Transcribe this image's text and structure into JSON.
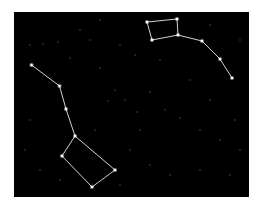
{
  "image": {
    "width": 263,
    "height": 208,
    "background": "#ffffff",
    "sky": {
      "x": 14,
      "y": 12,
      "width": 235,
      "height": 185,
      "color": "#000000"
    },
    "line_color": "#e8e8e8",
    "star_color": "#ffffff",
    "faint_star_color": "#5a5a5a"
  },
  "constellations": [
    {
      "name": "big-dipper",
      "stars": [
        [
          31.5,
          65
        ],
        [
          59.5,
          86
        ],
        [
          66,
          109
        ],
        [
          75,
          136
        ],
        [
          62,
          156
        ],
        [
          92,
          187
        ],
        [
          115,
          170
        ]
      ],
      "lines": [
        [
          0,
          1
        ],
        [
          1,
          2
        ],
        [
          2,
          3
        ],
        [
          3,
          4
        ],
        [
          4,
          5
        ],
        [
          5,
          6
        ],
        [
          6,
          3
        ]
      ]
    },
    {
      "name": "little-dipper",
      "stars": [
        [
          147,
          22
        ],
        [
          177,
          19
        ],
        [
          178,
          35
        ],
        [
          152,
          40
        ],
        [
          202,
          41
        ],
        [
          220,
          59
        ],
        [
          232,
          78
        ]
      ],
      "lines": [
        [
          0,
          1
        ],
        [
          1,
          2
        ],
        [
          2,
          3
        ],
        [
          3,
          0
        ],
        [
          2,
          4
        ],
        [
          4,
          5
        ],
        [
          5,
          6
        ]
      ]
    }
  ],
  "faint_stars": [
    [
      30,
      45
    ],
    [
      43,
      44
    ],
    [
      58,
      42
    ],
    [
      70,
      58
    ],
    [
      90,
      40
    ],
    [
      120,
      45
    ],
    [
      135,
      55
    ],
    [
      160,
      60
    ],
    [
      190,
      80
    ],
    [
      210,
      100
    ],
    [
      100,
      68
    ],
    [
      115,
      90
    ],
    [
      125,
      100
    ],
    [
      137,
      112
    ],
    [
      108,
      101
    ],
    [
      150,
      92
    ],
    [
      165,
      110
    ],
    [
      180,
      118
    ],
    [
      200,
      130
    ],
    [
      220,
      140
    ],
    [
      240,
      150
    ],
    [
      30,
      120
    ],
    [
      25,
      150
    ],
    [
      40,
      170
    ],
    [
      130,
      150
    ],
    [
      150,
      165
    ],
    [
      170,
      175
    ],
    [
      200,
      170
    ],
    [
      230,
      175
    ],
    [
      120,
      185
    ],
    [
      95,
      130
    ],
    [
      235,
      120
    ],
    [
      80,
      30
    ],
    [
      100,
      20
    ],
    [
      210,
      25
    ],
    [
      240,
      40
    ],
    [
      60,
      180
    ],
    [
      140,
      130
    ]
  ]
}
